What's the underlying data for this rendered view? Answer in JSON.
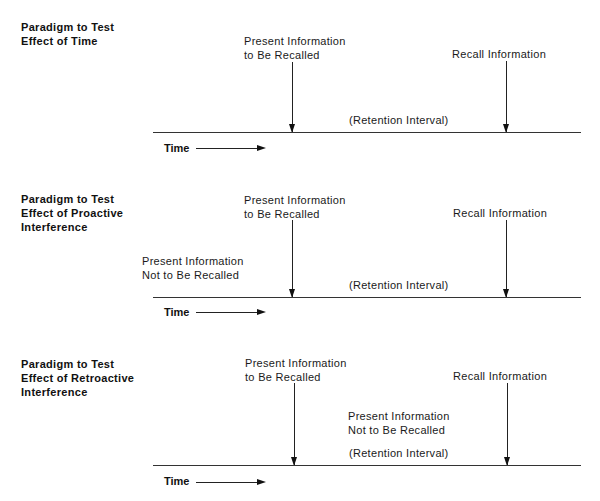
{
  "diagram": {
    "panels": [
      {
        "title": "Paradigm to Test\nEffect of Time",
        "present_label": "Present Information\nto Be Recalled",
        "recall_label": "Recall Information",
        "retention_label": "(Retention Interval)",
        "time_label": "Time"
      },
      {
        "title": "Paradigm to Test\nEffect of Proactive\nInterference",
        "interference_label": "Present Information\nNot to Be Recalled",
        "present_label": "Present Information\nto Be Recalled",
        "recall_label": "Recall Information",
        "retention_label": "(Retention Interval)",
        "time_label": "Time"
      },
      {
        "title": "Paradigm to Test\nEffect of Retroactive\nInterference",
        "present_label": "Present Information\nto Be Recalled",
        "interference_label": "Present Information\nNot to Be Recalled",
        "recall_label": "Recall Information",
        "retention_label": "(Retention Interval)",
        "time_label": "Time"
      }
    ],
    "colors": {
      "background": "#ffffff",
      "ink": "#1a1a1a"
    }
  }
}
